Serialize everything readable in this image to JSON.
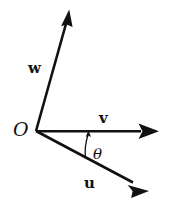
{
  "figure": {
    "type": "vector-diagram",
    "width": 171,
    "height": 201,
    "background_color": "#ffffff",
    "stroke_color": "#111111",
    "text_color": "#111111"
  },
  "origin": {
    "label": "O",
    "x": 36,
    "y": 131
  },
  "vectors": [
    {
      "name": "w",
      "label": "w",
      "label_x": 28,
      "label_y": 61,
      "start_x": 36,
      "start_y": 131,
      "end_x": 69,
      "end_y": 10,
      "direction": "up-right",
      "angle_deg_from_positive_x": 74.7
    },
    {
      "name": "v",
      "label": "v",
      "label_x": 99,
      "label_y": 111,
      "start_x": 36,
      "start_y": 131,
      "end_x": 159,
      "end_y": 131,
      "direction": "right",
      "angle_deg_from_positive_x": 0
    },
    {
      "name": "u",
      "label": "u",
      "label_x": 84,
      "label_y": 176,
      "start_x": 36,
      "start_y": 131,
      "end_x": 149,
      "end_y": 191,
      "direction": "down-right",
      "angle_deg_from_positive_x": -28
    }
  ],
  "angle_marker": {
    "label": "θ",
    "label_x": 93,
    "label_y": 147,
    "between": [
      "u",
      "v"
    ],
    "arc_radius": 55,
    "arc_start_x": 85,
    "arc_start_y": 157,
    "arc_end_x": 88,
    "arc_end_y": 131,
    "arrow_direction": "counterclockwise-toward-v"
  }
}
